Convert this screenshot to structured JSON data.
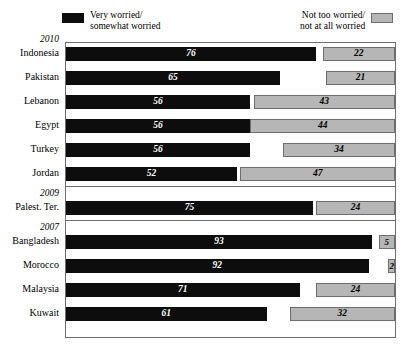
{
  "legend": {
    "left": {
      "icon": "black-square-swatch",
      "label": "Very worried/\nsomewhat worried",
      "color": "#0d0d0d"
    },
    "right": {
      "icon": "gray-square-swatch",
      "label": "Not too worried/\nnot at all worried",
      "color": "#b6b6b6"
    }
  },
  "chart_data": {
    "type": "bar",
    "title": "",
    "subtitle": "",
    "xlabel": "",
    "ylabel": "",
    "xlim": [
      0,
      100
    ],
    "grid": false,
    "legend_position": "top",
    "orientation": "horizontal",
    "stacked": "diverging-from-both-ends",
    "series": [
      {
        "name": "Very worried/somewhat worried",
        "color": "#0d0d0d",
        "align": "left",
        "values": [
          76,
          65,
          56,
          56,
          56,
          52,
          75,
          93,
          92,
          71,
          61
        ]
      },
      {
        "name": "Not too worried/not at all worried",
        "color": "#b6b6b6",
        "align": "right",
        "values": [
          22,
          21,
          43,
          44,
          34,
          47,
          24,
          5,
          2,
          24,
          32
        ]
      }
    ],
    "categories": [
      "Indonesia",
      "Pakistan",
      "Lebanon",
      "Egypt",
      "Turkey",
      "Jordan",
      "Palest. Ter.",
      "Bangladesh",
      "Morocco",
      "Malaysia",
      "Kuwait"
    ],
    "groups": [
      {
        "year": "2010",
        "categories": [
          "Indonesia",
          "Pakistan",
          "Lebanon",
          "Egypt",
          "Turkey",
          "Jordan"
        ]
      },
      {
        "year": "2009",
        "categories": [
          "Palest. Ter."
        ]
      },
      {
        "year": "2007",
        "categories": [
          "Bangladesh",
          "Morocco",
          "Malaysia",
          "Kuwait"
        ]
      }
    ],
    "rows": [
      {
        "group": "2010",
        "category": "Indonesia",
        "very": 76,
        "not": 22
      },
      {
        "group": "2010",
        "category": "Pakistan",
        "very": 65,
        "not": 21
      },
      {
        "group": "2010",
        "category": "Lebanon",
        "very": 56,
        "not": 43
      },
      {
        "group": "2010",
        "category": "Egypt",
        "very": 56,
        "not": 44
      },
      {
        "group": "2010",
        "category": "Turkey",
        "very": 56,
        "not": 34
      },
      {
        "group": "2010",
        "category": "Jordan",
        "very": 52,
        "not": 47
      },
      {
        "group": "2009",
        "category": "Palest. Ter.",
        "very": 75,
        "not": 24
      },
      {
        "group": "2007",
        "category": "Bangladesh",
        "very": 93,
        "not": 5
      },
      {
        "group": "2007",
        "category": "Morocco",
        "very": 92,
        "not": 2
      },
      {
        "group": "2007",
        "category": "Malaysia",
        "very": 71,
        "not": 24
      },
      {
        "group": "2007",
        "category": "Kuwait",
        "very": 61,
        "not": 32
      }
    ]
  }
}
